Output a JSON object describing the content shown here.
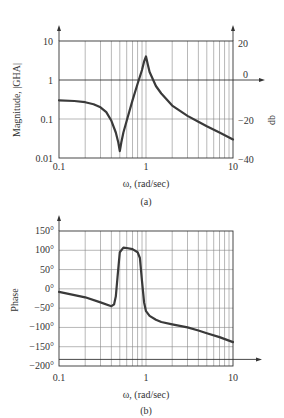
{
  "chart_data": [
    {
      "type": "line",
      "id": "a",
      "caption": "(a)",
      "title": "",
      "xlabel": "ω, (rad/sec)",
      "ylabel": "Magnitude, |GHA|",
      "ylabel_right": "db",
      "xscale": "log",
      "yscale": "log",
      "xlim": [
        0.1,
        10
      ],
      "ylim": [
        0.01,
        10
      ],
      "x_ticks": [
        "0.1",
        "1",
        "10"
      ],
      "y_ticks": [
        "0.01",
        "0.1",
        "1",
        "10"
      ],
      "y_ticks_right": [
        "−40",
        "−20",
        "0",
        "20"
      ],
      "grid": true,
      "series": [
        {
          "name": "|GHA|",
          "x": [
            0.1,
            0.15,
            0.2,
            0.25,
            0.3,
            0.35,
            0.4,
            0.45,
            0.48,
            0.5,
            0.52,
            0.55,
            0.6,
            0.7,
            0.8,
            0.9,
            0.95,
            1.0,
            1.05,
            1.1,
            1.3,
            1.5,
            2,
            3,
            4,
            5,
            7,
            10
          ],
          "values": [
            0.3,
            0.29,
            0.27,
            0.24,
            0.2,
            0.15,
            0.09,
            0.045,
            0.025,
            0.015,
            0.025,
            0.045,
            0.09,
            0.3,
            0.8,
            1.8,
            3.0,
            4.0,
            2.5,
            1.6,
            0.7,
            0.45,
            0.22,
            0.12,
            0.085,
            0.065,
            0.045,
            0.03
          ]
        }
      ]
    },
    {
      "type": "line",
      "id": "b",
      "caption": "(b)",
      "title": "",
      "xlabel": "ω, (rad/sec)",
      "ylabel": "Phase",
      "xscale": "log",
      "xlim": [
        0.1,
        10
      ],
      "ylim": [
        -200,
        150
      ],
      "x_ticks": [
        "0.1",
        "1",
        "10"
      ],
      "y_ticks": [
        "150°",
        "100°",
        "50°",
        "0°",
        "−50°",
        "−100°",
        "−150°",
        "−200°"
      ],
      "reference_line": -180,
      "grid": true,
      "series": [
        {
          "name": "Phase",
          "x": [
            0.1,
            0.2,
            0.3,
            0.4,
            0.43,
            0.45,
            0.47,
            0.5,
            0.55,
            0.6,
            0.7,
            0.8,
            0.85,
            0.9,
            0.95,
            1.0,
            1.1,
            1.3,
            1.5,
            2,
            3,
            4,
            5,
            7,
            10
          ],
          "values": [
            -8,
            -22,
            -35,
            -45,
            -40,
            -20,
            30,
            95,
            107,
            106,
            103,
            95,
            80,
            20,
            -35,
            -58,
            -70,
            -80,
            -86,
            -92,
            -100,
            -108,
            -115,
            -125,
            -138
          ]
        }
      ]
    }
  ],
  "labels": {
    "a": {
      "ylabel": "Magnitude, |GHA|",
      "ylabel_right": "db",
      "xlabel": "ω, (rad/sec)",
      "caption": "(a)",
      "x_ticks": [
        "0.1",
        "1",
        "10"
      ],
      "y_ticks": [
        "10",
        "1",
        "0.1",
        "0.01"
      ],
      "y_ticks_right": [
        "20",
        "0",
        "−20",
        "−40"
      ]
    },
    "b": {
      "ylabel": "Phase",
      "xlabel": "ω, (rad/sec)",
      "caption": "(b)",
      "x_ticks": [
        "0.1",
        "1",
        "10"
      ],
      "y_ticks": [
        "150°",
        "100°",
        "50°",
        "0°",
        "−50°",
        "−100°",
        "−150°",
        "−200°"
      ]
    }
  }
}
